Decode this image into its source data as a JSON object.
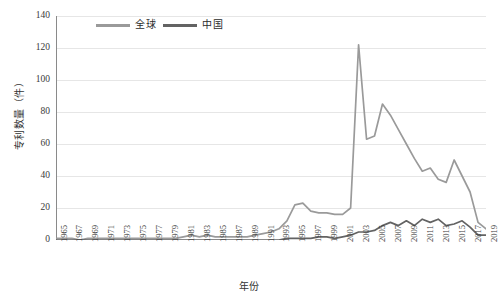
{
  "chart_data": {
    "type": "line",
    "title": "",
    "xlabel": "年份",
    "ylabel": "专利数量（件）",
    "ylim": [
      0,
      140
    ],
    "yticks": [
      0,
      20,
      40,
      60,
      80,
      100,
      120,
      140
    ],
    "grid": true,
    "legend_position": "top-left",
    "x": [
      1965,
      1966,
      1967,
      1968,
      1969,
      1970,
      1971,
      1972,
      1973,
      1974,
      1975,
      1976,
      1977,
      1978,
      1979,
      1980,
      1981,
      1982,
      1983,
      1984,
      1985,
      1986,
      1987,
      1988,
      1989,
      1990,
      1991,
      1992,
      1993,
      1994,
      1995,
      1996,
      1997,
      1998,
      1999,
      2000,
      2001,
      2002,
      2003,
      2004,
      2005,
      2006,
      2007,
      2008,
      2009,
      2010,
      2011,
      2012,
      2013,
      2014,
      2015,
      2016,
      2017,
      2018,
      2019
    ],
    "xtick_labels": [
      "1965",
      "1967",
      "1969",
      "1971",
      "1973",
      "1975",
      "1977",
      "1979",
      "1981",
      "1983",
      "1985",
      "1987",
      "1989",
      "1991",
      "1993",
      "1995",
      "1997",
      "1999",
      "2001",
      "2003",
      "2005",
      "2007",
      "2009",
      "2011",
      "2013",
      "2015",
      "2017",
      "2019"
    ],
    "series": [
      {
        "name": "全球",
        "color": "#9a9a9a",
        "values": [
          1,
          1,
          1,
          0,
          1,
          1,
          1,
          1,
          1,
          1,
          1,
          1,
          1,
          1,
          1,
          1,
          2,
          3,
          2,
          3,
          2,
          2,
          2,
          2,
          2,
          3,
          4,
          5,
          7,
          12,
          22,
          23,
          18,
          17,
          17,
          16,
          16,
          20,
          122,
          63,
          65,
          85,
          78,
          69,
          60,
          51,
          43,
          45,
          38,
          36,
          50,
          40,
          30,
          11,
          7
        ]
      },
      {
        "name": "中国",
        "color": "#636363",
        "values": [
          0,
          0,
          0,
          0,
          0,
          0,
          0,
          0,
          0,
          0,
          0,
          0,
          0,
          0,
          0,
          0,
          0,
          0,
          0,
          0,
          0,
          0,
          0,
          0,
          0,
          0,
          0,
          0,
          0,
          1,
          1,
          1,
          1,
          2,
          2,
          1,
          2,
          3,
          5,
          5,
          6,
          9,
          11,
          9,
          12,
          9,
          13,
          11,
          13,
          9,
          10,
          12,
          8,
          3,
          3
        ]
      }
    ]
  }
}
